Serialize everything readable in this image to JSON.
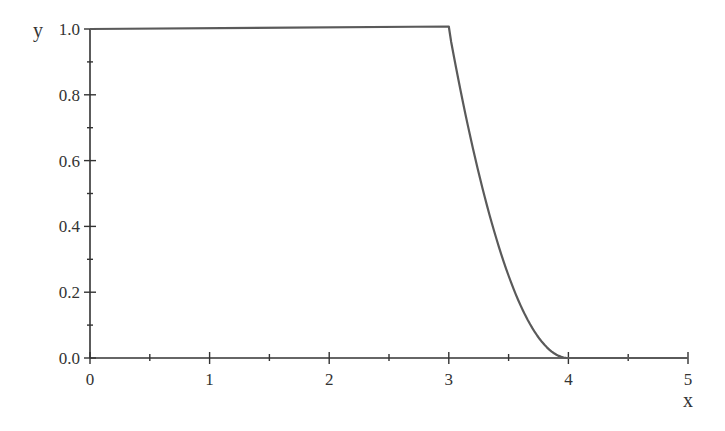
{
  "chart_data": {
    "type": "line",
    "title": "",
    "xlabel": "x",
    "ylabel": "y",
    "xlim": [
      0,
      5
    ],
    "ylim": [
      0,
      1
    ],
    "x_ticks": [
      "0",
      "1",
      "2",
      "3",
      "4",
      "5"
    ],
    "y_ticks": [
      "0.0",
      "0.2",
      "0.4",
      "0.6",
      "0.8",
      "1.0"
    ],
    "x_minor_step": 0.5,
    "y_minor_step": 0.1,
    "grid": false,
    "legend": null,
    "series": [
      {
        "name": "y",
        "color": "#5a5a5a",
        "description": "y = 1 for 0<=x<=3, y = (4-x)^2 for 3<=x<=4, y = 0 for 4<=x<=5",
        "x": [
          0,
          3,
          3.1,
          3.2,
          3.3,
          3.4,
          3.5,
          3.6,
          3.7,
          3.8,
          3.9,
          4,
          5
        ],
        "values": [
          1,
          1,
          0.81,
          0.64,
          0.49,
          0.36,
          0.25,
          0.16,
          0.09,
          0.04,
          0.01,
          0,
          0
        ]
      }
    ]
  },
  "colors": {
    "axis": "#333333",
    "line": "#5a5a5a",
    "background": "#ffffff"
  }
}
